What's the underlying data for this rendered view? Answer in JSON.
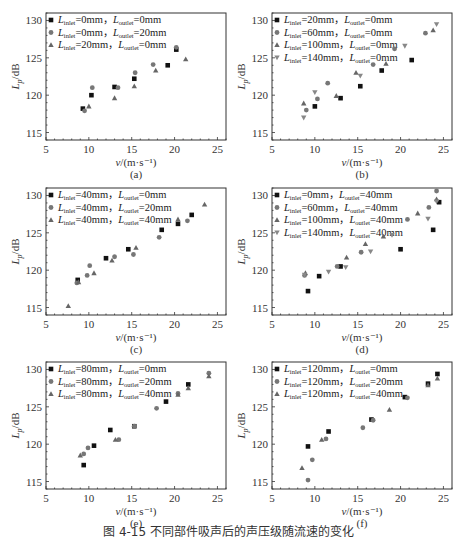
{
  "figure": {
    "caption": "图 4-15 不同部件吸声后的声压级随流速的变化"
  },
  "chart_data": [
    {
      "type": "scatter",
      "panel": "(a)",
      "xlabel": "v/(m·s⁻¹)",
      "ylabel": "Lp/dB",
      "xlim": [
        5,
        26
      ],
      "ylim": [
        114,
        131
      ],
      "xticks": [
        5,
        10,
        15,
        20,
        25
      ],
      "yticks": [
        115,
        120,
        125,
        130
      ],
      "legend_position": "top-left",
      "series": [
        {
          "name": "L_inlet=0mm, L_outlet=0mm",
          "label_parts": [
            "L",
            "inlet",
            "=0mm，",
            "L",
            "outlet",
            "=0mm"
          ],
          "marker": "square",
          "color": "#111111",
          "points": [
            [
              9.3,
              118.2
            ],
            [
              10.3,
              120.0
            ],
            [
              13.0,
              121.1
            ],
            [
              15.3,
              122.2
            ],
            [
              19.2,
              124.0
            ],
            [
              20.2,
              126.1
            ]
          ]
        },
        {
          "name": "L_inlet=0mm, L_outlet=20mm",
          "label_parts": [
            "L",
            "inlet",
            "=0mm，",
            "L",
            "outlet",
            "=20mm"
          ],
          "marker": "circle",
          "color": "#777777",
          "points": [
            [
              9.5,
              117.9
            ],
            [
              10.4,
              121.0
            ],
            [
              13.4,
              121.0
            ],
            [
              15.4,
              123.0
            ],
            [
              17.5,
              124.1
            ],
            [
              20.2,
              126.4
            ]
          ]
        },
        {
          "name": "L_inlet=20mm, L_outlet=0mm",
          "label_parts": [
            "L",
            "inlet",
            "=20mm，",
            "L",
            "outlet",
            "=0mm"
          ],
          "marker": "triangle-up",
          "color": "#666666",
          "points": [
            [
              10.0,
              118.5
            ],
            [
              13.0,
              119.6
            ],
            [
              15.3,
              121.2
            ],
            [
              17.8,
              123.3
            ],
            [
              21.3,
              124.8
            ]
          ]
        }
      ]
    },
    {
      "type": "scatter",
      "panel": "(b)",
      "xlabel": "v/(m·s⁻¹)",
      "ylabel": "Lp/dB",
      "xlim": [
        5,
        26
      ],
      "ylim": [
        114,
        131
      ],
      "xticks": [
        5,
        10,
        15,
        20,
        25
      ],
      "yticks": [
        115,
        120,
        125,
        130
      ],
      "legend_position": "top-left",
      "series": [
        {
          "name": "L_inlet=20mm, L_outlet=0mm",
          "label_parts": [
            "L",
            "inlet",
            "=20mm，",
            "L",
            "outlet",
            "=0mm"
          ],
          "marker": "square",
          "color": "#111111",
          "points": [
            [
              10.0,
              118.5
            ],
            [
              13.0,
              119.6
            ],
            [
              15.3,
              121.2
            ],
            [
              17.8,
              123.3
            ],
            [
              21.3,
              124.7
            ]
          ]
        },
        {
          "name": "L_inlet=60mm, L_outlet=0mm",
          "label_parts": [
            "L",
            "inlet",
            "=60mm，",
            "L",
            "outlet",
            "=0mm"
          ],
          "marker": "circle",
          "color": "#777777",
          "points": [
            [
              9.0,
              118.0
            ],
            [
              10.3,
              119.5
            ],
            [
              11.5,
              121.6
            ],
            [
              16.8,
              124.1
            ],
            [
              19.3,
              126.2
            ],
            [
              22.9,
              128.3
            ]
          ]
        },
        {
          "name": "L_inlet=100mm, L_outlet=0mm",
          "label_parts": [
            "L",
            "inlet",
            "=100mm，",
            "L",
            "outlet",
            "=0mm"
          ],
          "marker": "triangle-up",
          "color": "#666666",
          "points": [
            [
              8.7,
              118.9
            ],
            [
              12.5,
              119.9
            ],
            [
              14.8,
              123.0
            ],
            [
              18.3,
              124.2
            ],
            [
              23.8,
              128.7
            ]
          ]
        },
        {
          "name": "L_inlet=140mm, L_outlet=0mm",
          "label_parts": [
            "L",
            "inlet",
            "=140mm，",
            "L",
            "outlet",
            "=0mm"
          ],
          "marker": "triangle-down",
          "color": "#888888",
          "points": [
            [
              8.7,
              117.0
            ],
            [
              10.0,
              120.4
            ],
            [
              15.3,
              122.6
            ],
            [
              20.5,
              126.6
            ],
            [
              24.2,
              129.5
            ]
          ]
        }
      ]
    },
    {
      "type": "scatter",
      "panel": "(c)",
      "xlabel": "v/(m·s⁻¹)",
      "ylabel": "Lp/dB",
      "xlim": [
        5,
        26
      ],
      "ylim": [
        114,
        131
      ],
      "xticks": [
        5,
        10,
        15,
        20,
        25
      ],
      "yticks": [
        115,
        120,
        125,
        130
      ],
      "legend_position": "top-left",
      "series": [
        {
          "name": "L_inlet=40mm, L_outlet=0mm",
          "label_parts": [
            "L",
            "inlet",
            "=40mm，",
            "L",
            "outlet",
            "=0mm"
          ],
          "marker": "square",
          "color": "#111111",
          "points": [
            [
              8.7,
              118.7
            ],
            [
              12.0,
              121.6
            ],
            [
              14.6,
              122.8
            ],
            [
              18.5,
              125.4
            ],
            [
              20.4,
              126.2
            ],
            [
              22.0,
              127.4
            ]
          ]
        },
        {
          "name": "L_inlet=40mm, L_outlet=20mm",
          "label_parts": [
            "L",
            "inlet",
            "=40mm，",
            "L",
            "outlet",
            "=20mm"
          ],
          "marker": "circle",
          "color": "#777777",
          "points": [
            [
              8.6,
              118.3
            ],
            [
              9.8,
              119.3
            ],
            [
              10.1,
              120.6
            ],
            [
              13.0,
              121.8
            ],
            [
              15.2,
              122.1
            ],
            [
              18.2,
              124.4
            ],
            [
              21.5,
              126.6
            ]
          ]
        },
        {
          "name": "L_inlet=40mm, L_outlet=40mm",
          "label_parts": [
            "L",
            "inlet",
            "=40mm，",
            "L",
            "outlet",
            "=40mm"
          ],
          "marker": "triangle-up",
          "color": "#666666",
          "points": [
            [
              7.6,
              115.2
            ],
            [
              8.8,
              118.4
            ],
            [
              10.6,
              119.6
            ],
            [
              12.7,
              121.3
            ],
            [
              15.5,
              123.0
            ],
            [
              20.4,
              126.8
            ],
            [
              23.5,
              128.8
            ]
          ]
        }
      ]
    },
    {
      "type": "scatter",
      "panel": "(d)",
      "xlabel": "v/(m·s⁻¹)",
      "ylabel": "Lp/dB",
      "xlim": [
        5,
        26
      ],
      "ylim": [
        114,
        131
      ],
      "xticks": [
        5,
        10,
        15,
        20,
        25
      ],
      "yticks": [
        115,
        120,
        125,
        130
      ],
      "legend_position": "top-left",
      "series": [
        {
          "name": "L_inlet=0mm, L_outlet=40mm",
          "label_parts": [
            "L",
            "inlet",
            "=0mm，",
            "L",
            "outlet",
            "=40mm"
          ],
          "marker": "square",
          "color": "#111111",
          "points": [
            [
              9.2,
              117.2
            ],
            [
              10.5,
              119.2
            ],
            [
              13.0,
              120.5
            ],
            [
              20.0,
              122.8
            ],
            [
              23.8,
              125.4
            ],
            [
              24.5,
              129.1
            ]
          ]
        },
        {
          "name": "L_inlet=60mm, L_outlet=40mm",
          "label_parts": [
            "L",
            "inlet",
            "=60mm，",
            "L",
            "outlet",
            "=40mm"
          ],
          "marker": "circle",
          "color": "#777777",
          "points": [
            [
              8.8,
              119.3
            ],
            [
              12.6,
              120.5
            ],
            [
              15.4,
              122.4
            ],
            [
              20.8,
              126.8
            ],
            [
              23.3,
              128.4
            ],
            [
              24.2,
              130.6
            ]
          ]
        },
        {
          "name": "L_inlet=100mm, L_outlet=40mm",
          "label_parts": [
            "L",
            "inlet",
            "=100mm，",
            "L",
            "outlet",
            "=40mm"
          ],
          "marker": "triangle-up",
          "color": "#666666",
          "points": [
            [
              8.9,
              119.6
            ],
            [
              13.7,
              121.7
            ],
            [
              15.9,
              123.5
            ],
            [
              18.0,
              124.5
            ],
            [
              22.0,
              127.6
            ],
            [
              24.2,
              129.5
            ]
          ]
        },
        {
          "name": "L_inlet=140mm, L_outlet=40mm",
          "label_parts": [
            "L",
            "inlet",
            "=140mm，",
            "L",
            "outlet",
            "=40mm"
          ],
          "marker": "triangle-down",
          "color": "#888888",
          "points": [
            [
              8.8,
              119.4
            ],
            [
              11.6,
              119.8
            ],
            [
              13.6,
              120.4
            ],
            [
              16.5,
              122.5
            ],
            [
              19.0,
              124.7
            ],
            [
              23.2,
              126.9
            ],
            [
              24.2,
              129.2
            ]
          ]
        }
      ]
    },
    {
      "type": "scatter",
      "panel": "(e)",
      "xlabel": "v/(m·s⁻¹)",
      "ylabel": "Lp/dB",
      "xlim": [
        5,
        26
      ],
      "ylim": [
        114,
        131
      ],
      "xticks": [
        5,
        10,
        15,
        20,
        25
      ],
      "yticks": [
        115,
        120,
        125,
        130
      ],
      "legend_position": "top-left",
      "series": [
        {
          "name": "L_inlet=80mm, L_outlet=0mm",
          "label_parts": [
            "L",
            "inlet",
            "=80mm，",
            "L",
            "outlet",
            "=0mm"
          ],
          "marker": "square",
          "color": "#111111",
          "points": [
            [
              9.4,
              117.2
            ],
            [
              10.6,
              119.8
            ],
            [
              12.5,
              121.9
            ],
            [
              15.3,
              122.4
            ],
            [
              19.0,
              125.7
            ],
            [
              21.6,
              128.0
            ]
          ]
        },
        {
          "name": "L_inlet=80mm, L_outlet=20mm",
          "label_parts": [
            "L",
            "inlet",
            "=80mm，",
            "L",
            "outlet",
            "=20mm"
          ],
          "marker": "circle",
          "color": "#777777",
          "points": [
            [
              9.4,
              118.7
            ],
            [
              9.9,
              119.5
            ],
            [
              13.5,
              120.6
            ],
            [
              15.3,
              122.4
            ],
            [
              17.9,
              124.8
            ],
            [
              20.4,
              126.8
            ],
            [
              24.0,
              129.5
            ]
          ]
        },
        {
          "name": "L_inlet=80mm, L_outlet=40mm",
          "label_parts": [
            "L",
            "inlet",
            "=80mm，",
            "L",
            "outlet",
            "=40mm"
          ],
          "marker": "triangle-up",
          "color": "#666666",
          "points": [
            [
              9.0,
              118.5
            ],
            [
              13.1,
              120.6
            ],
            [
              20.4,
              126.6
            ],
            [
              21.6,
              127.5
            ],
            [
              24.0,
              129.1
            ]
          ]
        }
      ]
    },
    {
      "type": "scatter",
      "panel": "(f)",
      "xlabel": "v/(m·s⁻¹)",
      "ylabel": "Lp/dB",
      "xlim": [
        5,
        26
      ],
      "ylim": [
        114,
        131
      ],
      "xticks": [
        5,
        10,
        15,
        20,
        25
      ],
      "yticks": [
        115,
        120,
        125,
        130
      ],
      "legend_position": "top-left",
      "series": [
        {
          "name": "L_inlet=120mm, L_outlet=0mm",
          "label_parts": [
            "L",
            "inlet",
            "=120mm，",
            "L",
            "outlet",
            "=0mm"
          ],
          "marker": "square",
          "color": "#111111",
          "points": [
            [
              9.2,
              119.7
            ],
            [
              11.6,
              121.7
            ],
            [
              16.6,
              123.3
            ],
            [
              20.5,
              126.3
            ],
            [
              23.2,
              128.1
            ],
            [
              24.3,
              129.4
            ]
          ]
        },
        {
          "name": "L_inlet=120mm, L_outlet=20mm",
          "label_parts": [
            "L",
            "inlet",
            "=120mm，",
            "L",
            "outlet",
            "=20mm"
          ],
          "marker": "circle",
          "color": "#777777",
          "points": [
            [
              9.2,
              115.2
            ],
            [
              9.7,
              117.9
            ],
            [
              11.3,
              120.7
            ],
            [
              15.6,
              122.2
            ],
            [
              16.8,
              123.2
            ],
            [
              20.8,
              126.2
            ]
          ]
        },
        {
          "name": "L_inlet=120mm, L_outlet=40mm",
          "label_parts": [
            "L",
            "inlet",
            "=120mm，",
            "L",
            "outlet",
            "=40mm"
          ],
          "marker": "triangle-up",
          "color": "#666666",
          "points": [
            [
              8.5,
              116.8
            ],
            [
              10.8,
              120.6
            ],
            [
              18.7,
              124.6
            ],
            [
              23.2,
              127.9
            ],
            [
              24.3,
              128.8
            ]
          ]
        }
      ]
    }
  ]
}
